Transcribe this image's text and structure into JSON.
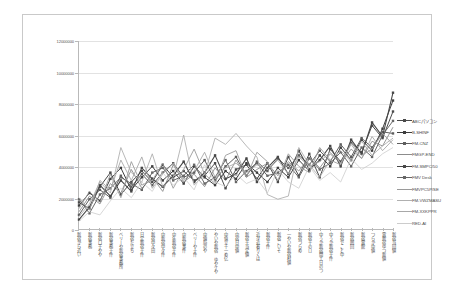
{
  "chart_data": {
    "type": "line",
    "title": "",
    "xlabel": "",
    "ylabel": "",
    "ylim": [
      0,
      12000000
    ],
    "grid": true,
    "legend_position": "right",
    "ytick_labels": [
      "0",
      "2000000",
      "4000000",
      "6000000",
      "8000000",
      "10000000",
      "12000000"
    ],
    "ytick_values": [
      0,
      2000000,
      4000000,
      6000000,
      8000000,
      10000000,
      12000000
    ],
    "categories": [
      "新宿から近い",
      "新宿事務",
      "新宿口千やや",
      "新宿事務十件",
      "ベリーや新宿事務所",
      "新宿た立ち",
      "日定新宿十件",
      "新宿中々田",
      "中新宿中々件",
      "中年新宿十件",
      "中新宿事件",
      "ベリーや十件",
      "中値局のや",
      "やいや新宿 ゆやケや",
      "中值立十一め亿",
      "中宿日中値",
      "新宿十当定値",
      "近々近着りくは",
      "新宿十件",
      "新宿こいそ",
      "一やいや新宿村値",
      "新宿つらめ",
      "新宿十のロ",
      "中うか新宿間エ日のつ",
      "中うか新宿十件",
      "新宿でこと中",
      "新宿囲回",
      "新宿電館",
      "つらか中値",
      "電新宿ゆつ新値",
      "新宿当回値"
    ],
    "series": [
      {
        "name": "ABCパソコン",
        "color": "#4a4a4a",
        "marker": "square",
        "width": 1.0,
        "values": [
          1700000,
          1300000,
          2700000,
          3600000,
          2200000,
          3000000,
          3700000,
          3000000,
          4100000,
          3300000,
          3700000,
          3100000,
          3400000,
          4200000,
          2600000,
          3800000,
          4100000,
          3200000,
          4200000,
          3000000,
          4600000,
          3400000,
          4800000,
          3300000,
          5100000,
          4300000,
          5500000,
          4900000,
          6600000,
          5800000,
          7500000
        ]
      },
      {
        "name": "B-SHINF",
        "color": "#3d3d3d",
        "marker": "square",
        "width": 1.0,
        "values": [
          1500000,
          2300000,
          1800000,
          3200000,
          3900000,
          2500000,
          3300000,
          4000000,
          3100000,
          3700000,
          2900000,
          4000000,
          3300000,
          2800000,
          3700000,
          3200000,
          4200000,
          3600000,
          3000000,
          3900000,
          3300000,
          4400000,
          3700000,
          4700000,
          4000000,
          5200000,
          4400000,
          5700000,
          5000000,
          6400000,
          8200000
        ]
      },
      {
        "name": "FM-CNZ",
        "color": "#5e5e5e",
        "marker": "square",
        "width": 1.0,
        "values": [
          900000,
          1900000,
          2500000,
          2000000,
          3400000,
          2700000,
          3500000,
          2800000,
          3600000,
          4200000,
          3300000,
          3600000,
          4400000,
          3100000,
          4000000,
          4600000,
          3400000,
          4300000,
          3700000,
          4500000,
          3900000,
          4700000,
          4100000,
          5000000,
          4300000,
          5400000,
          4600000,
          5800000,
          5200000,
          6200000,
          6100000
        ]
      },
      {
        "name": "FMGP-END",
        "color": "#8c8c8c",
        "marker": "none",
        "width": 0.9,
        "values": [
          1100000,
          2100000,
          1600000,
          2900000,
          2300000,
          3800000,
          2600000,
          3300000,
          2400000,
          4100000,
          3000000,
          3500000,
          2700000,
          3900000,
          3100000,
          4400000,
          3300000,
          3800000,
          4200000,
          3400000,
          4300000,
          3700000,
          4600000,
          3900000,
          4800000,
          4200000,
          5100000,
          4500000,
          5600000,
          5300000,
          6500000
        ]
      },
      {
        "name": "FM-SMPC/50",
        "color": "#474747",
        "marker": "square",
        "width": 1.1,
        "values": [
          600000,
          1400000,
          2800000,
          2100000,
          3100000,
          2400000,
          3900000,
          3200000,
          2700000,
          3400000,
          4300000,
          3000000,
          3600000,
          4700000,
          3200000,
          3500000,
          4500000,
          3000000,
          3900000,
          4600000,
          3500000,
          5000000,
          3800000,
          4400000,
          5300000,
          4000000,
          5700000,
          4800000,
          6800000,
          5900000,
          8700000
        ]
      },
      {
        "name": "FMV Desk",
        "color": "#666666",
        "marker": "square",
        "width": 1.0,
        "values": [
          1900000,
          1000000,
          2200000,
          2600000,
          3300000,
          2900000,
          2500000,
          3600000,
          3900000,
          3100000,
          3400000,
          4100000,
          2900000,
          3300000,
          4400000,
          3000000,
          3700000,
          4200000,
          3400000,
          3600000,
          4100000,
          3300000,
          4500000,
          3800000,
          4200000,
          4900000,
          4000000,
          5200000,
          4600000,
          6000000,
          6900000
        ]
      },
      {
        "name": "FMVPC5P/SE",
        "color": "#9a9a9a",
        "marker": "none",
        "width": 0.9,
        "values": [
          1300000,
          2400000,
          1700000,
          3500000,
          2000000,
          4300000,
          2800000,
          3100000,
          4200000,
          2600000,
          3800000,
          5100000,
          3500000,
          2900000,
          4700000,
          5000000,
          3300000,
          4900000,
          4300000,
          3100000,
          4800000,
          4000000,
          3600000,
          5200000,
          4400000,
          4100000,
          5500000,
          4700000,
          5100000,
          6100000,
          5400000
        ]
      },
      {
        "name": "FM-VWZMASU",
        "color": "#b0b0b0",
        "marker": "none",
        "width": 0.9,
        "values": [
          800000,
          1600000,
          3000000,
          2300000,
          5200000,
          3600000,
          3000000,
          4800000,
          2700000,
          3300000,
          6000000,
          2800000,
          3500000,
          5800000,
          5400000,
          6100000,
          5300000,
          4600000,
          2200000,
          1900000,
          2100000,
          5200000,
          4100000,
          3300000,
          4400000,
          5000000,
          4300000,
          5600000,
          4700000,
          5300000,
          5800000
        ]
      },
      {
        "name": "FM-XXKPPR",
        "color": "#a8a8a8",
        "marker": "none",
        "width": 0.9,
        "values": [
          2000000,
          1200000,
          3100000,
          2500000,
          4400000,
          3100000,
          4600000,
          2600000,
          3500000,
          4200000,
          3100000,
          3700000,
          4900000,
          3300000,
          3900000,
          4200000,
          3600000,
          4100000,
          3800000,
          4400000,
          3500000,
          4600000,
          4000000,
          4300000,
          4900000,
          4200000,
          5400000,
          4500000,
          5900000,
          5000000,
          5700000
        ]
      },
      {
        "name": "RED-AI",
        "color": "#cccccc",
        "marker": "none",
        "width": 0.8,
        "values": [
          500000,
          1100000,
          900000,
          1800000,
          2600000,
          2000000,
          3000000,
          2400000,
          3600000,
          2800000,
          3300000,
          2500000,
          4100000,
          3000000,
          2700000,
          3500000,
          2900000,
          3200000,
          2300000,
          3800000,
          3000000,
          2600000,
          4000000,
          3100000,
          3600000,
          3000000,
          4500000,
          3800000,
          4200000,
          4800000,
          5200000
        ]
      }
    ]
  }
}
